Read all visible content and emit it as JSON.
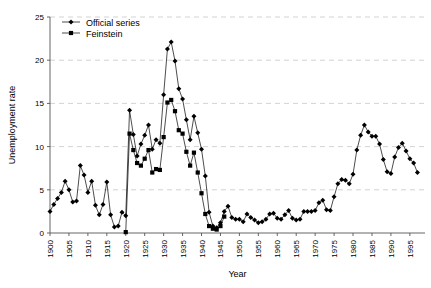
{
  "chart_data": {
    "type": "line",
    "title": "",
    "xlabel": "Year",
    "ylabel": "Unemployment rate",
    "xlim": [
      1900,
      1999
    ],
    "ylim": [
      0,
      25
    ],
    "yticks": [
      0,
      5,
      10,
      15,
      20,
      25
    ],
    "xticks": [
      1900,
      1905,
      1910,
      1915,
      1920,
      1925,
      1930,
      1935,
      1940,
      1945,
      1950,
      1955,
      1960,
      1965,
      1970,
      1975,
      1980,
      1985,
      1990,
      1995
    ],
    "grid": "horizontal-dashed",
    "legend_position": "top-left",
    "series": [
      {
        "name": "Official series",
        "marker": "diamond",
        "color": "#000000",
        "points": [
          [
            1900,
            2.5
          ],
          [
            1901,
            3.3
          ],
          [
            1902,
            4.0
          ],
          [
            1903,
            4.7
          ],
          [
            1904,
            6.0
          ],
          [
            1905,
            5.0
          ],
          [
            1906,
            3.6
          ],
          [
            1907,
            3.7
          ],
          [
            1908,
            7.8
          ],
          [
            1909,
            6.7
          ],
          [
            1910,
            4.7
          ],
          [
            1911,
            6.0
          ],
          [
            1912,
            3.2
          ],
          [
            1913,
            2.1
          ],
          [
            1914,
            3.3
          ],
          [
            1915,
            5.9
          ],
          [
            1916,
            2.1
          ],
          [
            1917,
            0.7
          ],
          [
            1918,
            0.8
          ],
          [
            1919,
            2.4
          ],
          [
            1920,
            2.0
          ],
          [
            1921,
            14.2
          ],
          [
            1922,
            11.4
          ],
          [
            1923,
            8.9
          ],
          [
            1924,
            10.3
          ],
          [
            1925,
            11.3
          ],
          [
            1926,
            12.5
          ],
          [
            1927,
            9.7
          ],
          [
            1928,
            10.8
          ],
          [
            1929,
            10.4
          ],
          [
            1930,
            16.0
          ],
          [
            1931,
            21.3
          ],
          [
            1932,
            22.1
          ],
          [
            1933,
            19.9
          ],
          [
            1934,
            16.7
          ],
          [
            1935,
            15.5
          ],
          [
            1936,
            13.1
          ],
          [
            1937,
            10.8
          ],
          [
            1938,
            13.5
          ],
          [
            1939,
            11.6
          ],
          [
            1940,
            9.7
          ],
          [
            1941,
            6.6
          ],
          [
            1942,
            2.4
          ],
          [
            1943,
            0.8
          ],
          [
            1944,
            0.6
          ],
          [
            1945,
            1.2
          ],
          [
            1946,
            2.5
          ],
          [
            1947,
            3.1
          ],
          [
            1948,
            1.8
          ],
          [
            1949,
            1.6
          ],
          [
            1950,
            1.6
          ],
          [
            1951,
            1.3
          ],
          [
            1952,
            2.2
          ],
          [
            1953,
            1.8
          ],
          [
            1954,
            1.5
          ],
          [
            1955,
            1.2
          ],
          [
            1956,
            1.3
          ],
          [
            1957,
            1.6
          ],
          [
            1958,
            2.2
          ],
          [
            1959,
            2.3
          ],
          [
            1960,
            1.7
          ],
          [
            1961,
            1.6
          ],
          [
            1962,
            2.1
          ],
          [
            1963,
            2.6
          ],
          [
            1964,
            1.7
          ],
          [
            1965,
            1.5
          ],
          [
            1966,
            1.6
          ],
          [
            1967,
            2.5
          ],
          [
            1968,
            2.5
          ],
          [
            1969,
            2.5
          ],
          [
            1970,
            2.6
          ],
          [
            1971,
            3.5
          ],
          [
            1972,
            3.8
          ],
          [
            1973,
            2.7
          ],
          [
            1974,
            2.6
          ],
          [
            1975,
            4.2
          ],
          [
            1976,
            5.7
          ],
          [
            1977,
            6.2
          ],
          [
            1978,
            6.1
          ],
          [
            1979,
            5.7
          ],
          [
            1980,
            6.8
          ],
          [
            1981,
            9.6
          ],
          [
            1982,
            11.3
          ],
          [
            1983,
            12.5
          ],
          [
            1984,
            11.7
          ],
          [
            1985,
            11.2
          ],
          [
            1986,
            11.2
          ],
          [
            1987,
            10.3
          ],
          [
            1988,
            8.5
          ],
          [
            1989,
            7.1
          ],
          [
            1990,
            6.9
          ],
          [
            1991,
            8.8
          ],
          [
            1992,
            9.9
          ],
          [
            1993,
            10.4
          ],
          [
            1994,
            9.5
          ],
          [
            1995,
            8.6
          ],
          [
            1996,
            8.1
          ],
          [
            1997,
            7.0
          ]
        ]
      },
      {
        "name": "Feinstein",
        "marker": "square",
        "color": "#000000",
        "points": [
          [
            1920,
            0.1
          ],
          [
            1921,
            11.5
          ],
          [
            1922,
            9.6
          ],
          [
            1923,
            8.1
          ],
          [
            1924,
            7.8
          ],
          [
            1925,
            8.6
          ],
          [
            1926,
            9.6
          ],
          [
            1927,
            7.0
          ],
          [
            1928,
            7.4
          ],
          [
            1929,
            7.3
          ],
          [
            1930,
            11.1
          ],
          [
            1931,
            15.1
          ],
          [
            1932,
            15.4
          ],
          [
            1933,
            14.1
          ],
          [
            1934,
            11.9
          ],
          [
            1935,
            11.5
          ],
          [
            1936,
            9.4
          ],
          [
            1937,
            7.8
          ],
          [
            1938,
            9.3
          ],
          [
            1939,
            7.0
          ],
          [
            1940,
            4.6
          ],
          [
            1941,
            2.2
          ],
          [
            1942,
            0.8
          ],
          [
            1943,
            0.5
          ],
          [
            1944,
            0.4
          ],
          [
            1945,
            0.8
          ],
          [
            1946,
            1.9
          ]
        ]
      }
    ]
  },
  "legend": {
    "items": [
      {
        "label": "Official series"
      },
      {
        "label": "Feinstein"
      }
    ]
  }
}
